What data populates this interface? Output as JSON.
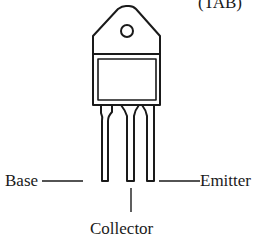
{
  "diagram": {
    "labels": {
      "tab": "(TAB)",
      "base": "Base",
      "collector": "Collector",
      "emitter": "Emitter"
    },
    "pins": [
      {
        "name": "Base",
        "position": "left"
      },
      {
        "name": "Collector",
        "position": "center"
      },
      {
        "name": "Emitter",
        "position": "right"
      }
    ],
    "colors": {
      "stroke": "#1a1a1a",
      "background": "#ffffff"
    }
  }
}
